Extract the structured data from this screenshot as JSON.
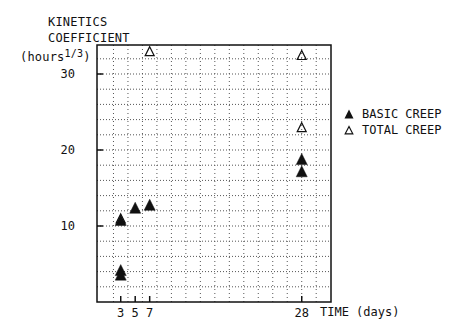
{
  "chart_data": {
    "type": "scatter",
    "title": "",
    "ylabel_lines": [
      "KINETICS",
      "COEFFICIENT",
      "(hours"
    ],
    "ylabel_exponent": "1/3",
    "ylabel_close": ")",
    "xlabel": "TIME (days)",
    "xlim": [
      0,
      32
    ],
    "ylim": [
      0,
      33.4
    ],
    "grid": true,
    "grid_style": "dotted",
    "x_ticks": [
      3,
      5,
      7,
      28
    ],
    "x_tick_labels": [
      "3",
      "5",
      "7",
      "28"
    ],
    "y_ticks": [
      10,
      20,
      30
    ],
    "y_tick_labels": [
      "10",
      "20",
      "30"
    ],
    "legend_position": "right",
    "series": [
      {
        "name": "BASIC CREEP",
        "marker": "filled-triangle",
        "points": [
          {
            "x": 3,
            "y": 10.8
          },
          {
            "x": 3,
            "y": 4.2
          },
          {
            "x": 3,
            "y": 3.6
          },
          {
            "x": 5,
            "y": 12.4
          },
          {
            "x": 7,
            "y": 12.8
          },
          {
            "x": 28,
            "y": 18.8
          },
          {
            "x": 28,
            "y": 17.2
          }
        ]
      },
      {
        "name": "TOTAL CREEP",
        "marker": "open-triangle",
        "points": [
          {
            "x": 3,
            "y": 11.0
          },
          {
            "x": 7,
            "y": 33.0
          },
          {
            "x": 28,
            "y": 32.5
          },
          {
            "x": 28,
            "y": 23.0
          }
        ]
      }
    ]
  },
  "legend": {
    "items": [
      {
        "label": "BASIC CREEP",
        "icon": "filled-triangle-icon"
      },
      {
        "label": "TOTAL CREEP",
        "icon": "open-triangle-icon"
      }
    ]
  },
  "colors": {
    "ink": "#111111",
    "grid": "#555555",
    "background": "#ffffff"
  }
}
